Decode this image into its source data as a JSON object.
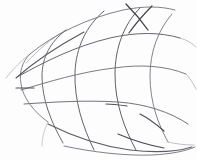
{
  "image": {
    "kind": "pencil-sketch",
    "subject": "curved wireframe mesh surface",
    "width": 197,
    "height": 160,
    "background_color": "#fefefe",
    "paper_tint": "#fdfdfd",
    "ink_color": "#6e6e74",
    "ink_color_dark": "#4a4a52",
    "ink_color_light": "#a8a8b0",
    "medium": "graphite pencil on white paper",
    "text_present": "none"
  },
  "chart_data": {
    "type": "line",
    "title": "",
    "subtitle": "",
    "xlabel": "",
    "ylabel": "",
    "xlim": [
      0,
      197
    ],
    "ylim": [
      0,
      160
    ],
    "grid": false,
    "legend": "none",
    "annotations": [],
    "series": [
      {
        "name": "meridian-1",
        "role": "vertical-curve",
        "stroke": "#77777e",
        "width": 0.9,
        "path": "M 30 54 C 22 62, 19 72, 21 84 C 23 98, 34 112, 48 122"
      },
      {
        "name": "meridian-2",
        "role": "vertical-curve",
        "stroke": "#6a6a72",
        "width": 1.0,
        "path": "M 66 30 C 50 42, 42 58, 42 76 C 42 99, 51 122, 63 143"
      },
      {
        "name": "meridian-3",
        "role": "vertical-curve",
        "stroke": "#63636b",
        "width": 1.0,
        "path": "M 104 11 C 86 26, 76 48, 75 72 C 74 101, 83 127, 94 150"
      },
      {
        "name": "meridian-4",
        "role": "vertical-curve",
        "stroke": "#5f5f68",
        "width": 1.0,
        "path": "M 140 8 C 124 24, 115 48, 115 74 C 115 103, 124 128, 136 150"
      },
      {
        "name": "meridian-5",
        "role": "vertical-curve",
        "stroke": "#74747c",
        "width": 0.9,
        "path": "M 172 14 C 158 30, 150 52, 150 76 C 150 102, 158 124, 168 142"
      },
      {
        "name": "latitude-1",
        "role": "horizontal-curve",
        "stroke": "#72727a",
        "width": 0.9,
        "path": "M 30 54 C 54 34, 88 18, 123 10 C 143 6, 160 6, 175 10"
      },
      {
        "name": "latitude-2",
        "role": "horizontal-curve",
        "stroke": "#66666e",
        "width": 1.0,
        "path": "M 19 76 C 44 62, 76 46, 110 38 C 136 32, 160 32, 180 38"
      },
      {
        "name": "latitude-3",
        "role": "horizontal-curve",
        "stroke": "#6c6c74",
        "width": 0.9,
        "path": "M 21 90 C 48 82, 80 72, 114 68 C 142 64, 166 66, 186 74"
      },
      {
        "name": "latitude-4",
        "role": "horizontal-curve",
        "stroke": "#6a6a73",
        "width": 0.95,
        "path": "M 24 104 C 54 102, 86 100, 118 102 C 146 104, 170 112, 188 124"
      },
      {
        "name": "latitude-5",
        "role": "horizontal-curve",
        "stroke": "#5d5d66",
        "width": 1.05,
        "path": "M 48 124 C 72 136, 100 146, 130 150 C 156 153, 176 152, 192 147"
      },
      {
        "name": "latitude-6-lower-rim",
        "role": "horizontal-curve",
        "stroke": "#70707a",
        "width": 0.9,
        "path": "M 64 146 C 92 152, 124 156, 152 155 C 172 154, 186 151, 195 147"
      }
    ],
    "accent_strokes": [
      {
        "name": "dark-cross-upper-right",
        "stroke": "#3f3f48",
        "width": 1.3,
        "path": "M 126 4 C 133 11, 141 20, 148 30"
      },
      {
        "name": "dark-cross-upper-right-b",
        "stroke": "#44444d",
        "width": 1.2,
        "path": "M 152 6 C 144 14, 136 23, 129 33"
      },
      {
        "name": "dark-upper-left-edge",
        "stroke": "#55555e",
        "width": 1.1,
        "path": "M 16 78 C 34 62, 58 46, 84 32"
      },
      {
        "name": "dark-node-left-mid",
        "stroke": "#4e4e57",
        "width": 1.2,
        "path": "M 16 88 C 22 88, 28 88, 34 88"
      },
      {
        "name": "dark-node-center",
        "stroke": "#4c4c55",
        "width": 1.2,
        "path": "M 106 104 C 113 104, 120 105, 127 106"
      },
      {
        "name": "dark-node-right",
        "stroke": "#4a4a53",
        "width": 1.2,
        "path": "M 140 114 C 148 118, 156 124, 164 131"
      },
      {
        "name": "dark-lower-convergence",
        "stroke": "#4b4b54",
        "width": 1.15,
        "path": "M 118 134 C 132 140, 148 145, 164 148"
      }
    ],
    "tail_strokes": [
      {
        "name": "tail-upper-left",
        "stroke": "#b4b4bc",
        "width": 0.8,
        "path": "M 30 54 C 22 60, 14 68, 6 78"
      },
      {
        "name": "tail-top-left-long",
        "stroke": "#a9a9b2",
        "width": 0.8,
        "path": "M 66 30 C 52 38, 38 50, 26 63"
      },
      {
        "name": "tail-right-1",
        "stroke": "#b0b0b8",
        "width": 0.8,
        "path": "M 180 38 C 187 40, 192 43, 196 47"
      },
      {
        "name": "tail-right-2",
        "stroke": "#aeaeb6",
        "width": 0.8,
        "path": "M 186 74 C 190 78, 193 83, 196 89"
      },
      {
        "name": "tail-bottom-left",
        "stroke": "#bbbbc2",
        "width": 0.75,
        "path": "M 48 122 C 44 130, 42 138, 42 146"
      },
      {
        "name": "tail-bottom-right",
        "stroke": "#b2b2ba",
        "width": 0.8,
        "path": "M 168 142 C 176 144, 185 145, 194 145"
      }
    ]
  }
}
